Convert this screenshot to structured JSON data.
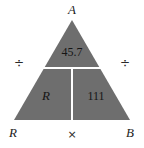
{
  "figure": {
    "type": "magic-triangle",
    "background_color": "#ffffff",
    "fill_color": "#6e6e6e",
    "divider_color": "#ffffff",
    "vertices": {
      "apex_label": "A",
      "bottom_left_label": "R",
      "bottom_right_label": "B"
    },
    "operators": {
      "left": "÷",
      "right": "÷",
      "bottom": "×"
    },
    "cells": {
      "top": "45.7",
      "bottom_left": "R",
      "bottom_right": "111"
    }
  }
}
